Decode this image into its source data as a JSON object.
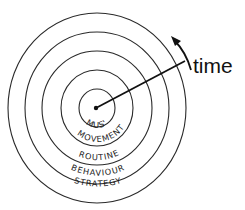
{
  "diagram": {
    "type": "concentric-circles",
    "center_label": "MUS'",
    "rings": [
      {
        "label": "MUS'",
        "level": 1
      },
      {
        "label": "MOVEMENT",
        "level": 2
      },
      {
        "label": "ROUTINE",
        "level": 3
      },
      {
        "label": "BEHAVIOUR",
        "level": 4
      },
      {
        "label": "STRATEGY",
        "level": 5
      }
    ],
    "axis_label": "time",
    "arrow_direction": "counter-clockwise"
  }
}
